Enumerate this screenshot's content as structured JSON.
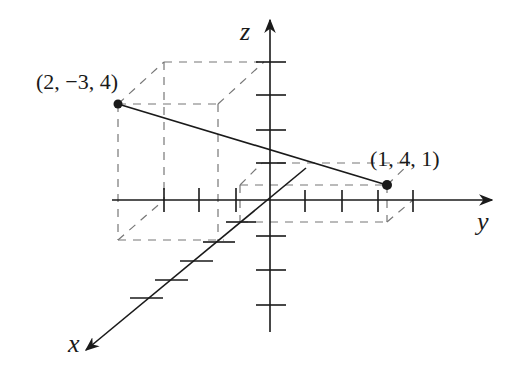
{
  "diagram": {
    "type": "3d-coordinate-system",
    "axes": {
      "x": {
        "label": "x"
      },
      "y": {
        "label": "y"
      },
      "z": {
        "label": "z"
      }
    },
    "points": [
      {
        "label": "(2, −3, 4)",
        "coords": [
          2,
          -3,
          4
        ]
      },
      {
        "label": "(1, 4, 1)",
        "coords": [
          1,
          4,
          1
        ]
      }
    ],
    "segment": {
      "from": "(2, −3, 4)",
      "to": "(1, 4, 1)"
    },
    "colors": {
      "ink": "#1a1a1a",
      "dashed": "#777777",
      "background": "#ffffff"
    }
  }
}
